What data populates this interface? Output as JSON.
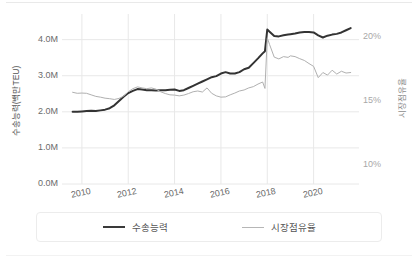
{
  "chart_data": {
    "type": "line",
    "title": "",
    "subtitle": "",
    "xlabel": "",
    "ylabel": "수송능력(백만TEU)",
    "y2label": "시장점유율",
    "grid": true,
    "legend_position": "bottom",
    "x": [
      2009.6,
      2009.8,
      2010.0,
      2010.2,
      2010.4,
      2010.6,
      2010.8,
      2011.0,
      2011.2,
      2011.4,
      2011.6,
      2011.8,
      2012.0,
      2012.2,
      2012.4,
      2012.6,
      2012.8,
      2013.0,
      2013.2,
      2013.4,
      2013.6,
      2013.8,
      2014.0,
      2014.2,
      2014.4,
      2014.6,
      2014.8,
      2015.0,
      2015.2,
      2015.4,
      2015.6,
      2015.8,
      2016.0,
      2016.2,
      2016.4,
      2016.6,
      2016.8,
      2017.0,
      2017.2,
      2017.4,
      2017.6,
      2017.8,
      2017.9,
      2018.0,
      2018.1,
      2018.3,
      2018.5,
      2018.7,
      2018.9,
      2019.0,
      2019.2,
      2019.4,
      2019.6,
      2019.8,
      2020.0,
      2020.2,
      2020.4,
      2020.6,
      2020.8,
      2021.0,
      2021.2,
      2021.4,
      2021.6
    ],
    "xlim": [
      2009.4,
      2021.7
    ],
    "xticks": [
      2010,
      2012,
      2014,
      2016,
      2018,
      2020
    ],
    "xticklabels": [
      "2010",
      "2012",
      "2014",
      "2016",
      "2018",
      "2020"
    ],
    "y_left_lim": [
      0.0,
      4.6
    ],
    "y_left_ticks": [
      0.0,
      1.0,
      2.0,
      3.0,
      4.0
    ],
    "y_left_ticklabels": [
      "0.0M",
      "1.0M",
      "2.0M",
      "3.0M",
      "4.0M"
    ],
    "y_right_lim": [
      8.53,
      21.47
    ],
    "y_right_ticks": [
      10,
      15,
      20
    ],
    "y_right_ticklabels": [
      "10%",
      "15%",
      "20%"
    ],
    "series": [
      {
        "name": "수송능력",
        "axis": "left",
        "unit": "백만TEU",
        "color": "#333333",
        "width": 2.0,
        "values": [
          2.0,
          2.0,
          2.01,
          2.02,
          2.03,
          2.02,
          2.04,
          2.06,
          2.1,
          2.18,
          2.3,
          2.42,
          2.52,
          2.58,
          2.63,
          2.62,
          2.6,
          2.6,
          2.59,
          2.6,
          2.6,
          2.61,
          2.62,
          2.58,
          2.6,
          2.66,
          2.72,
          2.78,
          2.84,
          2.9,
          2.96,
          2.99,
          3.06,
          3.1,
          3.06,
          3.06,
          3.1,
          3.18,
          3.22,
          3.35,
          3.48,
          3.62,
          3.68,
          4.28,
          4.22,
          4.1,
          4.09,
          4.12,
          4.14,
          4.15,
          4.17,
          4.2,
          4.21,
          4.21,
          4.2,
          4.12,
          4.06,
          4.11,
          4.14,
          4.16,
          4.2,
          4.26,
          4.32
        ]
      },
      {
        "name": "시장점유율",
        "axis": "right",
        "unit": "%",
        "color": "#b0b0b0",
        "width": 1.0,
        "values": [
          15.68,
          15.6,
          15.62,
          15.6,
          15.48,
          15.36,
          15.3,
          15.22,
          15.18,
          15.12,
          15.2,
          15.38,
          15.72,
          15.96,
          16.1,
          16.02,
          15.96,
          16.02,
          15.92,
          15.72,
          15.58,
          15.48,
          15.46,
          15.4,
          15.46,
          15.58,
          15.72,
          15.78,
          15.7,
          16.02,
          15.6,
          15.4,
          15.3,
          15.32,
          15.48,
          15.62,
          15.78,
          15.86,
          16.02,
          16.12,
          16.32,
          16.48,
          15.98,
          19.92,
          19.4,
          18.42,
          18.28,
          18.46,
          18.4,
          18.52,
          18.46,
          18.3,
          18.16,
          17.92,
          17.7,
          16.82,
          17.22,
          17.02,
          17.4,
          17.1,
          17.32,
          17.18,
          17.22
        ]
      }
    ]
  },
  "legend": {
    "items": [
      {
        "label": "수송능력",
        "style": "primary"
      },
      {
        "label": "시장점유율",
        "style": "secondary"
      }
    ]
  },
  "axes": {
    "left_title": "수송능력(백만TEU)",
    "right_title": "시장점유율"
  },
  "colors": {
    "primary_line": "#333333",
    "secondary_line": "#b0b0b0",
    "grid": "#e8e8e8",
    "tick_text": "#6b6b6b",
    "right_tick_text": "#a8a8a8"
  }
}
